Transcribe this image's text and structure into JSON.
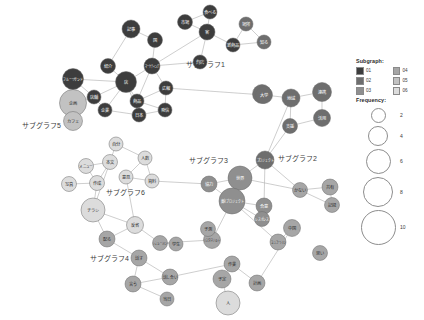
{
  "legend": {
    "subgraph_heading": "Subgraph:",
    "frequency_heading": "Frequency:",
    "subgraph_items": [
      {
        "label": "01",
        "color": "#3d3d3d"
      },
      {
        "label": "02",
        "color": "#6e6e6e"
      },
      {
        "label": "03",
        "color": "#8f8f8f"
      },
      {
        "label": "04",
        "color": "#a6a6a6"
      },
      {
        "label": "05",
        "color": "#c2c2c2"
      },
      {
        "label": "06",
        "color": "#dcdcdc"
      }
    ],
    "frequency_items": [
      {
        "value": "2",
        "diameter": 13
      },
      {
        "value": "4",
        "diameter": 18
      },
      {
        "value": "6",
        "diameter": 23
      },
      {
        "value": "8",
        "diameter": 28
      },
      {
        "value": "10",
        "diameter": 33
      }
    ]
  },
  "cluster_labels": [
    {
      "text": "サブグラフ1",
      "x": 186,
      "y": 64
    },
    {
      "text": "サブグラフ2",
      "x": 278,
      "y": 158
    },
    {
      "text": "サブグラフ3",
      "x": 189,
      "y": 160
    },
    {
      "text": "サブグラフ4",
      "x": 90,
      "y": 258
    },
    {
      "text": "サブグラフ5",
      "x": 22,
      "y": 125
    },
    {
      "text": "サブグラフ6",
      "x": 106,
      "y": 192
    }
  ],
  "chart_data": {
    "type": "network",
    "title": "",
    "node_color_field": "subgraph",
    "node_size_field": "frequency",
    "nodes": [
      {
        "id": "n01",
        "label": "企画",
        "x": 73,
        "y": 103,
        "r": 13.5,
        "subgraph": "05",
        "frequency": 8
      },
      {
        "id": "n02",
        "label": "カフェ",
        "x": 73,
        "y": 121,
        "r": 9.5,
        "subgraph": "05",
        "frequency": 5
      },
      {
        "id": "n03",
        "label": "フルーツサンド",
        "x": 73,
        "y": 79,
        "r": 10.5,
        "subgraph": "01",
        "frequency": 6
      },
      {
        "id": "n04",
        "label": "紹介",
        "x": 108,
        "y": 66,
        "r": 7.5,
        "subgraph": "01",
        "frequency": 4
      },
      {
        "id": "n05",
        "label": "店舗",
        "x": 94,
        "y": 97,
        "r": 7,
        "subgraph": "01",
        "frequency": 3
      },
      {
        "id": "n06",
        "label": "店",
        "x": 126,
        "y": 82,
        "r": 10.5,
        "subgraph": "01",
        "frequency": 6
      },
      {
        "id": "n07",
        "label": "記事",
        "x": 131,
        "y": 29,
        "r": 9,
        "subgraph": "01",
        "frequency": 5
      },
      {
        "id": "n08",
        "label": "国",
        "x": 155,
        "y": 40,
        "r": 7.5,
        "subgraph": "01",
        "frequency": 4
      },
      {
        "id": "n09",
        "label": "マーケティング",
        "x": 152,
        "y": 66,
        "r": 8,
        "subgraph": "01",
        "frequency": 4
      },
      {
        "id": "n10",
        "label": "商品",
        "x": 137,
        "y": 101,
        "r": 7,
        "subgraph": "01",
        "frequency": 3
      },
      {
        "id": "n11",
        "label": "広報",
        "x": 166,
        "y": 88,
        "r": 7,
        "subgraph": "01",
        "frequency": 3
      },
      {
        "id": "n12",
        "label": "企業",
        "x": 105,
        "y": 110,
        "r": 7,
        "subgraph": "01",
        "frequency": 3
      },
      {
        "id": "n13",
        "label": "日本",
        "x": 139,
        "y": 115,
        "r": 7,
        "subgraph": "01",
        "frequency": 3
      },
      {
        "id": "n14",
        "label": "発信",
        "x": 165,
        "y": 110,
        "r": 7,
        "subgraph": "01",
        "frequency": 3
      },
      {
        "id": "n15",
        "label": "市場",
        "x": 185,
        "y": 22,
        "r": 7.5,
        "subgraph": "01",
        "frequency": 4
      },
      {
        "id": "n16",
        "label": "食べる",
        "x": 210,
        "y": 12,
        "r": 7,
        "subgraph": "01",
        "frequency": 3
      },
      {
        "id": "n17",
        "label": "客",
        "x": 207,
        "y": 32,
        "r": 8,
        "subgraph": "01",
        "frequency": 4
      },
      {
        "id": "n18",
        "label": "新商品",
        "x": 233,
        "y": 45,
        "r": 7,
        "subgraph": "01",
        "frequency": 3
      },
      {
        "id": "n19",
        "label": "場所",
        "x": 246,
        "y": 24,
        "r": 7,
        "subgraph": "02",
        "frequency": 3
      },
      {
        "id": "n20",
        "label": "知る",
        "x": 264,
        "y": 42,
        "r": 7,
        "subgraph": "02",
        "frequency": 3
      },
      {
        "id": "n21",
        "label": "商店",
        "x": 200,
        "y": 62,
        "r": 7,
        "subgraph": "01",
        "frequency": 3
      },
      {
        "id": "n22",
        "label": "アプリ",
        "x": 262,
        "y": 94,
        "r": 9.5,
        "subgraph": "02",
        "frequency": 5
      },
      {
        "id": "n23",
        "label": "大学",
        "x": 264,
        "y": 95,
        "r": 8.5,
        "subgraph": "02",
        "frequency": 5
      },
      {
        "id": "n24",
        "label": "地域",
        "x": 291,
        "y": 98,
        "r": 9,
        "subgraph": "02",
        "frequency": 5
      },
      {
        "id": "n25",
        "label": "連携",
        "x": 322,
        "y": 92,
        "r": 9.5,
        "subgraph": "02",
        "frequency": 5
      },
      {
        "id": "n26",
        "label": "活用",
        "x": 322,
        "y": 118,
        "r": 8.5,
        "subgraph": "02",
        "frequency": 5
      },
      {
        "id": "n27",
        "label": "支援",
        "x": 290,
        "y": 126,
        "r": 7.5,
        "subgraph": "02",
        "frequency": 4
      },
      {
        "id": "n28",
        "label": "プロジェクト",
        "x": 265,
        "y": 160,
        "r": 9,
        "subgraph": "02",
        "frequency": 5
      },
      {
        "id": "n29",
        "label": "世界",
        "x": 240,
        "y": 178,
        "r": 12,
        "subgraph": "03",
        "frequency": 7
      },
      {
        "id": "n30",
        "label": "東京プロジェクト",
        "x": 232,
        "y": 201,
        "r": 13,
        "subgraph": "03",
        "frequency": 8
      },
      {
        "id": "n31",
        "label": "協力",
        "x": 209,
        "y": 184,
        "r": 8,
        "subgraph": "03",
        "frequency": 4
      },
      {
        "id": "n32",
        "label": "合意",
        "x": 264,
        "y": 206,
        "r": 8,
        "subgraph": "03",
        "frequency": 4
      },
      {
        "id": "n33",
        "label": "レスポンス",
        "x": 262,
        "y": 219,
        "r": 7.5,
        "subgraph": "03",
        "frequency": 4
      },
      {
        "id": "n34",
        "label": "かない",
        "x": 300,
        "y": 190,
        "r": 7.5,
        "subgraph": "04",
        "frequency": 4
      },
      {
        "id": "n35",
        "label": "共有",
        "x": 330,
        "y": 187,
        "r": 8,
        "subgraph": "04",
        "frequency": 4
      },
      {
        "id": "n36",
        "label": "記録",
        "x": 332,
        "y": 205,
        "r": 7.5,
        "subgraph": "04",
        "frequency": 4
      },
      {
        "id": "n37",
        "label": "中国",
        "x": 292,
        "y": 228,
        "r": 8.5,
        "subgraph": "04",
        "frequency": 5
      },
      {
        "id": "n38",
        "label": "コミュニケーション",
        "x": 278,
        "y": 242,
        "r": 8,
        "subgraph": "04",
        "frequency": 4
      },
      {
        "id": "n39",
        "label": "思い",
        "x": 320,
        "y": 253,
        "r": 7.5,
        "subgraph": "04",
        "frequency": 4
      },
      {
        "id": "n40",
        "label": "メニュー",
        "x": 86,
        "y": 166,
        "r": 7.5,
        "subgraph": "06",
        "frequency": 4
      },
      {
        "id": "n41",
        "label": "本文",
        "x": 110,
        "y": 162,
        "r": 7.5,
        "subgraph": "06",
        "frequency": 4
      },
      {
        "id": "n42",
        "label": "写真",
        "x": 69,
        "y": 184,
        "r": 7.5,
        "subgraph": "06",
        "frequency": 4
      },
      {
        "id": "n43",
        "label": "作成",
        "x": 97,
        "y": 183,
        "r": 7.5,
        "subgraph": "06",
        "frequency": 4
      },
      {
        "id": "n44",
        "label": "自分",
        "x": 116,
        "y": 144,
        "r": 7,
        "subgraph": "06",
        "frequency": 3
      },
      {
        "id": "n45",
        "label": "人数",
        "x": 145,
        "y": 158,
        "r": 7,
        "subgraph": "06",
        "frequency": 3
      },
      {
        "id": "n46",
        "label": "資料",
        "x": 152,
        "y": 181,
        "r": 7,
        "subgraph": "06",
        "frequency": 3
      },
      {
        "id": "n47",
        "label": "意見",
        "x": 126,
        "y": 177,
        "r": 7,
        "subgraph": "06",
        "frequency": 3
      },
      {
        "id": "n48",
        "label": "チラシ",
        "x": 93,
        "y": 210,
        "r": 12,
        "subgraph": "06",
        "frequency": 7
      },
      {
        "id": "n49",
        "label": "反省",
        "x": 135,
        "y": 225,
        "r": 8.5,
        "subgraph": "06",
        "frequency": 5
      },
      {
        "id": "n50",
        "label": "配る",
        "x": 107,
        "y": 239,
        "r": 8,
        "subgraph": "04",
        "frequency": 4
      },
      {
        "id": "n51",
        "label": "シミュレーション",
        "x": 160,
        "y": 243,
        "r": 7.5,
        "subgraph": "04",
        "frequency": 4
      },
      {
        "id": "n52",
        "label": "話す",
        "x": 139,
        "y": 258,
        "r": 8,
        "subgraph": "04",
        "frequency": 4
      },
      {
        "id": "n53",
        "label": "言う",
        "x": 133,
        "y": 284,
        "r": 8,
        "subgraph": "04",
        "frequency": 4
      },
      {
        "id": "n54",
        "label": "話し合い",
        "x": 170,
        "y": 277,
        "r": 8,
        "subgraph": "04",
        "frequency": 4
      },
      {
        "id": "n55",
        "label": "リスクマネジメント",
        "x": 212,
        "y": 240,
        "r": 8.5,
        "subgraph": "04",
        "frequency": 5
      },
      {
        "id": "n56",
        "label": "予測",
        "x": 208,
        "y": 229,
        "r": 7.5,
        "subgraph": "04",
        "frequency": 4
      },
      {
        "id": "n57",
        "label": "作業",
        "x": 232,
        "y": 264,
        "r": 8,
        "subgraph": "04",
        "frequency": 4
      },
      {
        "id": "n58",
        "label": "予定",
        "x": 222,
        "y": 279,
        "r": 9,
        "subgraph": "04",
        "frequency": 5
      },
      {
        "id": "n59",
        "label": "計画",
        "x": 257,
        "y": 283,
        "r": 8,
        "subgraph": "04",
        "frequency": 4
      },
      {
        "id": "n60",
        "label": "人",
        "x": 228,
        "y": 303,
        "r": 12,
        "subgraph": "06",
        "frequency": 7
      },
      {
        "id": "n61",
        "label": "学生",
        "x": 176,
        "y": 244,
        "r": 7,
        "subgraph": "04",
        "frequency": 3
      },
      {
        "id": "n62",
        "label": "当日",
        "x": 167,
        "y": 299,
        "r": 7,
        "subgraph": "04",
        "frequency": 3
      }
    ],
    "edges": [
      [
        "n01",
        "n02"
      ],
      [
        "n01",
        "n03"
      ],
      [
        "n01",
        "n05"
      ],
      [
        "n03",
        "n05"
      ],
      [
        "n03",
        "n06"
      ],
      [
        "n04",
        "n06"
      ],
      [
        "n04",
        "n07"
      ],
      [
        "n05",
        "n06"
      ],
      [
        "n05",
        "n12"
      ],
      [
        "n06",
        "n09"
      ],
      [
        "n06",
        "n10"
      ],
      [
        "n06",
        "n12"
      ],
      [
        "n06",
        "n13"
      ],
      [
        "n07",
        "n08"
      ],
      [
        "n08",
        "n09"
      ],
      [
        "n09",
        "n10"
      ],
      [
        "n09",
        "n11"
      ],
      [
        "n09",
        "n17"
      ],
      [
        "n10",
        "n11"
      ],
      [
        "n10",
        "n13"
      ],
      [
        "n10",
        "n14"
      ],
      [
        "n11",
        "n14"
      ],
      [
        "n12",
        "n13"
      ],
      [
        "n13",
        "n14"
      ],
      [
        "n15",
        "n16"
      ],
      [
        "n15",
        "n17"
      ],
      [
        "n16",
        "n17"
      ],
      [
        "n17",
        "n18"
      ],
      [
        "n18",
        "n19"
      ],
      [
        "n18",
        "n20"
      ],
      [
        "n19",
        "n20"
      ],
      [
        "n17",
        "n21"
      ],
      [
        "n09",
        "n21"
      ],
      [
        "n11",
        "n23"
      ],
      [
        "n22",
        "n23"
      ],
      [
        "n23",
        "n24"
      ],
      [
        "n24",
        "n25"
      ],
      [
        "n24",
        "n27"
      ],
      [
        "n25",
        "n26"
      ],
      [
        "n26",
        "n27"
      ],
      [
        "n27",
        "n28"
      ],
      [
        "n24",
        "n28"
      ],
      [
        "n28",
        "n29"
      ],
      [
        "n28",
        "n32"
      ],
      [
        "n29",
        "n30"
      ],
      [
        "n29",
        "n31"
      ],
      [
        "n30",
        "n31"
      ],
      [
        "n30",
        "n32"
      ],
      [
        "n30",
        "n33"
      ],
      [
        "n32",
        "n33"
      ],
      [
        "n28",
        "n34"
      ],
      [
        "n34",
        "n35"
      ],
      [
        "n34",
        "n36"
      ],
      [
        "n35",
        "n36"
      ],
      [
        "n37",
        "n38"
      ],
      [
        "n30",
        "n38"
      ],
      [
        "n40",
        "n41"
      ],
      [
        "n40",
        "n43"
      ],
      [
        "n41",
        "n43"
      ],
      [
        "n41",
        "n44"
      ],
      [
        "n42",
        "n43"
      ],
      [
        "n43",
        "n48"
      ],
      [
        "n41",
        "n48"
      ],
      [
        "n44",
        "n45"
      ],
      [
        "n45",
        "n46"
      ],
      [
        "n45",
        "n47"
      ],
      [
        "n46",
        "n47"
      ],
      [
        "n47",
        "n49"
      ],
      [
        "n48",
        "n49"
      ],
      [
        "n48",
        "n50"
      ],
      [
        "n49",
        "n50"
      ],
      [
        "n49",
        "n51"
      ],
      [
        "n50",
        "n52"
      ],
      [
        "n52",
        "n53"
      ],
      [
        "n52",
        "n54"
      ],
      [
        "n53",
        "n54"
      ],
      [
        "n51",
        "n61"
      ],
      [
        "n55",
        "n56"
      ],
      [
        "n51",
        "n55"
      ],
      [
        "n54",
        "n57"
      ],
      [
        "n57",
        "n58"
      ],
      [
        "n57",
        "n59"
      ],
      [
        "n58",
        "n60"
      ],
      [
        "n53",
        "n62"
      ],
      [
        "n30",
        "n55"
      ],
      [
        "n31",
        "n46"
      ],
      [
        "n29",
        "n34"
      ],
      [
        "n37",
        "n59"
      ]
    ]
  }
}
